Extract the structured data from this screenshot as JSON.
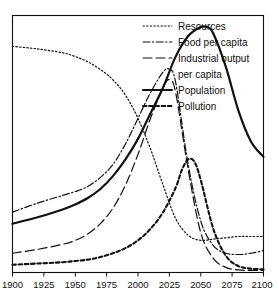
{
  "chart_data": {
    "type": "line",
    "title": "",
    "subtitle": "",
    "xlabel": "",
    "ylabel": "",
    "xlim": [
      1900,
      2100
    ],
    "ylim": [
      0,
      1
    ],
    "grid": false,
    "legend_position": "top-right",
    "xticks": [
      "1900",
      "1925",
      "1950",
      "1975",
      "2000",
      "2025",
      "2050",
      "2075",
      "2100"
    ],
    "xtick_values": [
      1900,
      1925,
      1950,
      1975,
      2000,
      2025,
      2050,
      2075,
      2100
    ],
    "yticks": [],
    "series": [
      {
        "name": "Resources",
        "style": "dotted",
        "x": [
          1900,
          1920,
          1940,
          1950,
          1960,
          1970,
          1980,
          1990,
          2000,
          2010,
          2020,
          2030,
          2040,
          2050,
          2060,
          2070,
          2080,
          2090,
          2100
        ],
        "values": [
          0.88,
          0.87,
          0.855,
          0.84,
          0.82,
          0.79,
          0.75,
          0.69,
          0.6,
          0.48,
          0.34,
          0.21,
          0.145,
          0.125,
          0.13,
          0.135,
          0.14,
          0.14,
          0.14
        ]
      },
      {
        "name": "Food per capita",
        "style": "dash-dot",
        "x": [
          1900,
          1920,
          1940,
          1950,
          1960,
          1970,
          1980,
          1990,
          2000,
          2010,
          2020,
          2025,
          2030,
          2040,
          2050,
          2060,
          2070,
          2080,
          2090,
          2100
        ],
        "values": [
          0.235,
          0.27,
          0.3,
          0.315,
          0.335,
          0.37,
          0.42,
          0.5,
          0.6,
          0.7,
          0.78,
          0.79,
          0.74,
          0.42,
          0.2,
          0.105,
          0.075,
          0.07,
          0.075,
          0.085
        ]
      },
      {
        "name": "Industrial output per capita",
        "style": "dashed",
        "x": [
          1900,
          1920,
          1940,
          1950,
          1960,
          1970,
          1980,
          1990,
          2000,
          2010,
          2020,
          2025,
          2030,
          2040,
          2050,
          2060,
          2070,
          2080,
          2090,
          2100
        ],
        "values": [
          0.075,
          0.09,
          0.11,
          0.125,
          0.15,
          0.19,
          0.25,
          0.34,
          0.46,
          0.6,
          0.72,
          0.75,
          0.7,
          0.4,
          0.155,
          0.055,
          0.02,
          0.01,
          0.008,
          0.008
        ]
      },
      {
        "name": "Population",
        "style": "solid",
        "x": [
          1900,
          1920,
          1940,
          1950,
          1960,
          1970,
          1980,
          1990,
          2000,
          2010,
          2020,
          2030,
          2040,
          2050,
          2055,
          2060,
          2070,
          2080,
          2090,
          2100
        ],
        "values": [
          0.19,
          0.215,
          0.245,
          0.265,
          0.29,
          0.325,
          0.375,
          0.44,
          0.52,
          0.62,
          0.72,
          0.84,
          0.92,
          0.955,
          0.955,
          0.93,
          0.8,
          0.63,
          0.51,
          0.45
        ]
      },
      {
        "name": "Pollution",
        "style": "short-dash",
        "x": [
          1900,
          1920,
          1940,
          1950,
          1960,
          1970,
          1980,
          1990,
          2000,
          2010,
          2020,
          2030,
          2035,
          2040,
          2045,
          2050,
          2060,
          2070,
          2080,
          2090,
          2100
        ],
        "values": [
          0.03,
          0.035,
          0.04,
          0.045,
          0.05,
          0.06,
          0.075,
          0.095,
          0.125,
          0.17,
          0.235,
          0.33,
          0.4,
          0.44,
          0.43,
          0.36,
          0.17,
          0.065,
          0.025,
          0.015,
          0.012
        ]
      }
    ],
    "legend": [
      {
        "label": "Resources",
        "style": "dotted"
      },
      {
        "label": "Food per capita",
        "style": "dash-dot"
      },
      {
        "label": "Industrial output",
        "style": "dashed"
      },
      {
        "label": "per capita",
        "style": "continuation"
      },
      {
        "label": "Population",
        "style": "solid"
      },
      {
        "label": "Pollution",
        "style": "short-dash"
      }
    ]
  },
  "colors": {
    "ink": "#111111",
    "background": "#ffffff"
  }
}
